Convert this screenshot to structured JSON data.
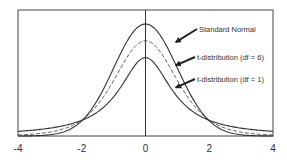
{
  "chart_data": {
    "type": "line",
    "title": "",
    "xlabel": "",
    "ylabel": "",
    "xlim": [
      -4,
      4
    ],
    "ylim": [
      0,
      0.45
    ],
    "x_ticks": [
      -4,
      -2,
      0,
      2,
      4
    ],
    "x_tick_labels": [
      "-4",
      "-2",
      "0",
      "2",
      "4"
    ],
    "y_ticks": [],
    "grid": false,
    "legend": "none",
    "series": [
      {
        "name": "Standard Normal",
        "distribution": "normal",
        "df": null,
        "peak": 0.4,
        "style": "solid"
      },
      {
        "name": "t-distribution (df = 6)",
        "distribution": "t",
        "df": 6,
        "peak": 0.34,
        "style": "dashed"
      },
      {
        "name": "t-distribution (df = 1)",
        "distribution": "t",
        "df": 1,
        "peak": 0.28,
        "style": "solid"
      }
    ],
    "annotations": [
      {
        "text": "Standard Normal",
        "target_series": 0,
        "arrow_tip": [
          0.95,
          0.335
        ]
      },
      {
        "text": "t-distribution (df = 6)",
        "target_series": 1,
        "arrow_tip": [
          0.95,
          0.252
        ]
      },
      {
        "text": "t-distribution (df = 1)",
        "target_series": 2,
        "arrow_tip": [
          0.95,
          0.173
        ]
      }
    ],
    "colors": {
      "line": "#333333",
      "frame": "#444444",
      "text": "#333333"
    }
  }
}
